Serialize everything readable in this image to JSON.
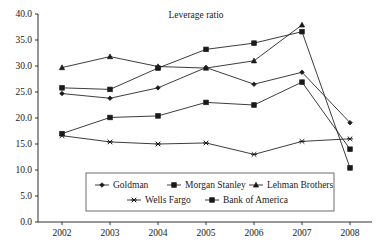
{
  "chart_data": {
    "type": "line",
    "title": "Leverage ratio",
    "xlabel": "",
    "ylabel": "",
    "x": [
      "2002",
      "2003",
      "2004",
      "2005",
      "2006",
      "2007",
      "2008"
    ],
    "categories": [
      "2002",
      "2003",
      "2004",
      "2005",
      "2006",
      "2007",
      "2008"
    ],
    "ylim": [
      0.0,
      40.0
    ],
    "ytick_labels": [
      "0.0",
      "5.0",
      "10.0",
      "15.0",
      "20.0",
      "25.0",
      "30.0",
      "35.0",
      "40.0"
    ],
    "ytick_values": [
      0.0,
      5.0,
      10.0,
      15.0,
      20.0,
      25.0,
      30.0,
      35.0,
      40.0
    ],
    "xtick_labels": [
      "2002",
      "2003",
      "2004",
      "2005",
      "2006",
      "2007",
      "2008"
    ],
    "grid": false,
    "legend_position": "bottom-center",
    "series": [
      {
        "name": "Goldman",
        "marker": "diamond",
        "values": [
          24.7,
          23.8,
          25.8,
          29.7,
          26.5,
          28.8,
          19.1
        ]
      },
      {
        "name": "Morgan Stanley",
        "marker": "square",
        "values": [
          25.8,
          25.5,
          29.6,
          33.2,
          34.4,
          36.6,
          10.4
        ]
      },
      {
        "name": "Lehman Brothers",
        "marker": "triangle",
        "values": [
          29.7,
          31.8,
          29.9,
          29.6,
          31.0,
          37.9,
          null
        ]
      },
      {
        "name": "Wells Fargo",
        "marker": "x",
        "values": [
          16.6,
          15.4,
          15.0,
          15.2,
          13.0,
          15.5,
          16.0
        ]
      },
      {
        "name": "Bank of America",
        "marker": "square",
        "values": [
          17.0,
          20.1,
          20.4,
          23.0,
          22.5,
          26.9,
          14.0
        ]
      }
    ]
  },
  "legend": {
    "row1": [
      "Goldman",
      "Morgan Stanley",
      "Lehman Brothers"
    ],
    "row2": [
      "Wells Fargo",
      "Bank of America"
    ]
  },
  "colors": {
    "ink": "#1a1a1a",
    "background": "#ffffff",
    "legend_border": "#4a4a4a"
  }
}
